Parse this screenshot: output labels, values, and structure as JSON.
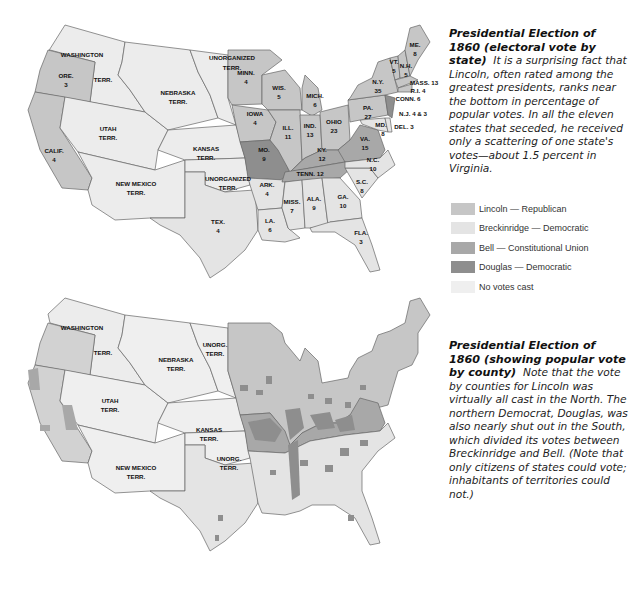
{
  "colors": {
    "lincoln": "#c6c6c6",
    "breckinridge": "#e4e4e4",
    "bell": "#a8a8a8",
    "douglas": "#8e8e8e",
    "no_votes": "#efefef",
    "border": "#555555"
  },
  "legend": {
    "items": [
      {
        "key": "lincoln",
        "label": "Lincoln — Republican"
      },
      {
        "key": "breckinridge",
        "label": "Breckinridge — Democratic"
      },
      {
        "key": "bell",
        "label": "Bell — Constitutional Union"
      },
      {
        "key": "douglas",
        "label": "Douglas — Democratic"
      },
      {
        "key": "no_votes",
        "label": "No votes cast"
      }
    ]
  },
  "captions": {
    "top": {
      "title": "Presidential Election of 1860 (electoral vote by state)",
      "body": "It is a surprising fact that Lincoln, often rated among the greatest presidents, ranks near the bottom in percentage of popular votes. In all the eleven states that seceded, he received only a scattering of one state's votes—about 1.5 percent in Virginia."
    },
    "bottom": {
      "title": "Presidential Election of 1860 (showing popular vote by county)",
      "body": "Note that the vote by counties for Lincoln was virtually all cast in the North. The northern Democrat, Douglas, was also nearly shut out in the South, which divided its votes between Breckinridge and Bell. (Note that only citizens of states could vote; inhabitants of territories could not.)"
    }
  },
  "map_top": {
    "labels": {
      "washington": "WASHINGTON",
      "washington_terr": "TERR.",
      "ore": "ORE.",
      "ore_votes": "3",
      "calif": "CALIF.",
      "calif_votes": "4",
      "utah": "UTAH",
      "utah_terr": "TERR.",
      "nebraska": "NEBRASKA",
      "nebraska_terr": "TERR.",
      "unorganized": "UNORGANIZED",
      "unorganized_terr": "TERR.",
      "kansas": "KANSAS",
      "kansas_terr": "TERR.",
      "new_mexico": "NEW MEXICO",
      "new_mexico_terr": "TERR.",
      "unorg_south": "UNORGANIZED",
      "unorg_south_terr": "TERR.",
      "tex": "TEX.",
      "tex_votes": "4",
      "minn": "MINN.",
      "minn_votes": "4",
      "wis": "WIS.",
      "wis_votes": "5",
      "iowa": "IOWA",
      "iowa_votes": "4",
      "mo": "MO.",
      "mo_votes": "9",
      "ark": "ARK.",
      "ark_votes": "4",
      "la": "LA.",
      "la_votes": "6",
      "ill": "ILL.",
      "ill_votes": "11",
      "mich": "MICH.",
      "mich_votes": "6",
      "ind": "IND.",
      "ind_votes": "13",
      "ohio": "OHIO",
      "ohio_votes": "23",
      "ky": "KY.",
      "ky_votes": "12",
      "tenn": "TENN. 12",
      "miss": "MISS.",
      "miss_votes": "7",
      "ala": "ALA.",
      "ala_votes": "9",
      "ga": "GA.",
      "ga_votes": "10",
      "fla": "FLA.",
      "fla_votes": "3",
      "sc": "S.C.",
      "sc_votes": "8",
      "nc": "N.C.",
      "nc_votes": "10",
      "va": "VA.",
      "va_votes": "15",
      "md": "MD.",
      "md_votes": "8",
      "del": "DEL. 3",
      "nj": "N.J. 4 & 3",
      "pa": "PA.",
      "pa_votes": "27",
      "ny": "N.Y.",
      "ny_votes": "35",
      "conn": "CONN. 6",
      "ri": "R.I. 4",
      "mass": "MASS. 13",
      "vt": "VT.",
      "vt_votes": "5",
      "nh": "N.H.",
      "nh_votes": "5",
      "me": "ME.",
      "me_votes": "8"
    }
  },
  "map_bottom": {
    "labels": {
      "washington": "WASHINGTON",
      "washington_terr": "TERR.",
      "nebraska": "NEBRASKA",
      "nebraska_terr": "TERR.",
      "unorg": "UNORG.",
      "unorg_terr": "TERR.",
      "utah": "UTAH",
      "utah_terr": "TERR.",
      "kansas": "KANSAS",
      "kansas_terr": "TERR.",
      "new_mexico": "NEW MEXICO",
      "new_mexico_terr": "TERR.",
      "unorg_south": "UNORG.",
      "unorg_south_terr": "TERR."
    }
  }
}
